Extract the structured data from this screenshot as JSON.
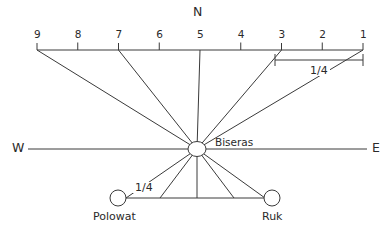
{
  "figure": {
    "type": "star-compass-diagram",
    "background": "#ffffff",
    "stroke": "#3a3a3a",
    "cardinals": {
      "north": "N",
      "west": "W",
      "east": "E"
    },
    "center_node": {
      "label": "Biseras"
    },
    "scale": {
      "labels": [
        "9",
        "8",
        "7",
        "6",
        "5",
        "4",
        "3",
        "2",
        "1"
      ],
      "x_positions": [
        37,
        77.75,
        118.5,
        159.25,
        200,
        240.75,
        281.5,
        322.25,
        363
      ],
      "baseline_y": 50,
      "ray_targets": [
        "9",
        "7",
        "5",
        "3",
        "1"
      ]
    },
    "brackets": [
      {
        "label": "1/4",
        "position": "top-right",
        "from": "3",
        "to": "1"
      },
      {
        "label": "1/4",
        "position": "bottom-left",
        "near": "Polowat"
      }
    ],
    "bottom_nodes": [
      {
        "label": "Polowat",
        "side": "left"
      },
      {
        "label": "Ruk",
        "side": "right"
      }
    ]
  }
}
